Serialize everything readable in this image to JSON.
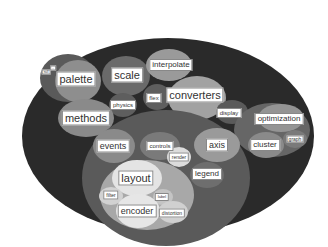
{
  "diagram": {
    "type": "circle-packing",
    "colors": {
      "background": "#ffffff",
      "root": "#2a2a2a",
      "group": "#5a5a5a",
      "node_dark": "#6e6e6e",
      "node_mid": "#8a8a8a",
      "node_light": "#a8a8a8",
      "node_lighter": "#c4c4c4",
      "node_lightest": "#e6e6e6",
      "label_bg": "#ffffff"
    },
    "nodes": {
      "palette": "palette",
      "null": "null",
      "dots": "..",
      "scale": "scale",
      "interpolate": "interpolate",
      "flex": "flex",
      "converters": "converters",
      "physics": "physics",
      "methods": "methods",
      "display": "display",
      "optimization": "optimization",
      "cluster": "cluster",
      "graph": "graph",
      "events": "events",
      "controls": "controls",
      "render": "render",
      "axis": "axis",
      "legend": "legend",
      "layout": "layout",
      "filter": "filter",
      "label": "label",
      "encoder": "encoder",
      "distortion": "distortion"
    }
  }
}
